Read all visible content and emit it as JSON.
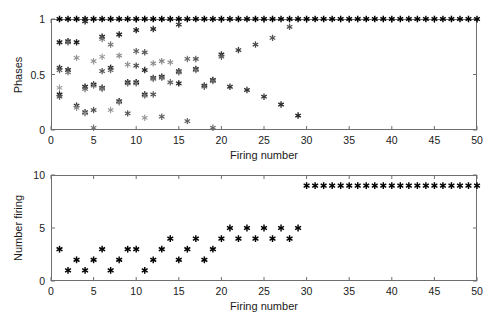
{
  "figure": {
    "background": "#ffffff",
    "axis_color": "#6e6e6e",
    "marker_color": "#111111",
    "marker_glyph": "asterisk"
  },
  "chart_data": [
    {
      "type": "scatter",
      "id": "phases-panel",
      "title": "",
      "xlabel": "Firing number",
      "ylabel": "Phases",
      "xlim": [
        0,
        50
      ],
      "ylim": [
        0,
        1
      ],
      "xticks": [
        0,
        5,
        10,
        15,
        20,
        25,
        30,
        35,
        40,
        45,
        50
      ],
      "xticklabels": [
        "0",
        "5",
        "10",
        "15",
        "20",
        "25",
        "30",
        "35",
        "40",
        "45",
        "50"
      ],
      "yticks": [
        0,
        0.5,
        1
      ],
      "yticklabels": [
        "0",
        "0.5",
        "1"
      ],
      "grid": false,
      "legend": null,
      "series": [
        {
          "name": "reference phase",
          "note": "locked at phase 1 for every firing",
          "x": [
            1,
            2,
            3,
            4,
            5,
            6,
            7,
            8,
            9,
            10,
            11,
            12,
            13,
            14,
            15,
            16,
            17,
            18,
            19,
            20,
            21,
            22,
            23,
            24,
            25,
            26,
            27,
            28,
            29,
            30,
            31,
            32,
            33,
            34,
            35,
            36,
            37,
            38,
            39,
            40,
            41,
            42,
            43,
            44,
            45,
            46,
            47,
            48,
            49,
            50
          ],
          "y": [
            1,
            1,
            1,
            1,
            1,
            1,
            1,
            1,
            1,
            1,
            1,
            1,
            1,
            1,
            1,
            1,
            1,
            1,
            1,
            1,
            1,
            1,
            1,
            1,
            1,
            1,
            1,
            1,
            1,
            1,
            1,
            1,
            1,
            1,
            1,
            1,
            1,
            1,
            1,
            1,
            1,
            1,
            1,
            1,
            1,
            1,
            1,
            1,
            1,
            1
          ],
          "shade": [
            1,
            1,
            1,
            1,
            1,
            1,
            1,
            1,
            1,
            1,
            1,
            1,
            1,
            1,
            1,
            1,
            1,
            1,
            1,
            1,
            1,
            1,
            1,
            1,
            1,
            1,
            1,
            1,
            1,
            1,
            1,
            1,
            1,
            1,
            1,
            1,
            1,
            1,
            1,
            1,
            1,
            1,
            1,
            1,
            1,
            1,
            1,
            1,
            1,
            1
          ]
        },
        {
          "name": "oscillator phases",
          "note": "scattered sub-unity phases, greyscale encodes oscillator index",
          "points": [
            {
              "x": 1,
              "y": 0.79,
              "shade": 0.85
            },
            {
              "x": 1,
              "y": 0.56,
              "shade": 0.8
            },
            {
              "x": 1,
              "y": 0.54,
              "shade": 0.55
            },
            {
              "x": 1,
              "y": 0.32,
              "shade": 0.85
            },
            {
              "x": 1,
              "y": 0.3,
              "shade": 0.6
            },
            {
              "x": 1,
              "y": 0.38,
              "shade": 0.25
            },
            {
              "x": 2,
              "y": 0.8,
              "shade": 0.85
            },
            {
              "x": 2,
              "y": 0.79,
              "shade": 0.5
            },
            {
              "x": 2,
              "y": 0.54,
              "shade": 0.85
            },
            {
              "x": 2,
              "y": 0.52,
              "shade": 0.45
            },
            {
              "x": 3,
              "y": 0.79,
              "shade": 0.85
            },
            {
              "x": 3,
              "y": 0.65,
              "shade": 0.3
            },
            {
              "x": 3,
              "y": 0.22,
              "shade": 0.75
            },
            {
              "x": 3,
              "y": 0.2,
              "shade": 0.35
            },
            {
              "x": 4,
              "y": 0.98,
              "shade": 0.8
            },
            {
              "x": 4,
              "y": 0.39,
              "shade": 0.85
            },
            {
              "x": 4,
              "y": 0.37,
              "shade": 0.5
            },
            {
              "x": 4,
              "y": 0.16,
              "shade": 0.75
            },
            {
              "x": 4,
              "y": 0.15,
              "shade": 0.3
            },
            {
              "x": 5,
              "y": 0.62,
              "shade": 0.3
            },
            {
              "x": 5,
              "y": 0.41,
              "shade": 0.85
            },
            {
              "x": 5,
              "y": 0.4,
              "shade": 0.45
            },
            {
              "x": 5,
              "y": 0.18,
              "shade": 0.6
            },
            {
              "x": 5,
              "y": 0.02,
              "shade": 0.45
            },
            {
              "x": 6,
              "y": 0.84,
              "shade": 0.85
            },
            {
              "x": 6,
              "y": 0.82,
              "shade": 0.45
            },
            {
              "x": 6,
              "y": 0.66,
              "shade": 0.3
            },
            {
              "x": 6,
              "y": 0.53,
              "shade": 0.6
            },
            {
              "x": 6,
              "y": 0.38,
              "shade": 0.85
            },
            {
              "x": 6,
              "y": 0.37,
              "shade": 0.4
            },
            {
              "x": 7,
              "y": 0.77,
              "shade": 0.45
            },
            {
              "x": 7,
              "y": 0.56,
              "shade": 0.85
            },
            {
              "x": 7,
              "y": 0.54,
              "shade": 0.5
            },
            {
              "x": 7,
              "y": 0.18,
              "shade": 0.3
            },
            {
              "x": 8,
              "y": 0.86,
              "shade": 0.85
            },
            {
              "x": 8,
              "y": 0.67,
              "shade": 0.35
            },
            {
              "x": 8,
              "y": 0.26,
              "shade": 0.85
            },
            {
              "x": 8,
              "y": 0.25,
              "shade": 0.4
            },
            {
              "x": 9,
              "y": 0.59,
              "shade": 0.35
            },
            {
              "x": 9,
              "y": 0.43,
              "shade": 0.85
            },
            {
              "x": 9,
              "y": 0.42,
              "shade": 0.5
            },
            {
              "x": 9,
              "y": 0.15,
              "shade": 0.6
            },
            {
              "x": 10,
              "y": 0.9,
              "shade": 0.85
            },
            {
              "x": 10,
              "y": 0.71,
              "shade": 0.55
            },
            {
              "x": 10,
              "y": 0.58,
              "shade": 0.65
            },
            {
              "x": 10,
              "y": 0.43,
              "shade": 0.85
            },
            {
              "x": 10,
              "y": 0.42,
              "shade": 0.45
            },
            {
              "x": 11,
              "y": 0.7,
              "shade": 0.6
            },
            {
              "x": 11,
              "y": 0.54,
              "shade": 0.8
            },
            {
              "x": 11,
              "y": 0.32,
              "shade": 0.85
            },
            {
              "x": 11,
              "y": 0.31,
              "shade": 0.4
            },
            {
              "x": 11,
              "y": 0.11,
              "shade": 0.3
            },
            {
              "x": 12,
              "y": 0.91,
              "shade": 0.8
            },
            {
              "x": 12,
              "y": 0.6,
              "shade": 0.35
            },
            {
              "x": 12,
              "y": 0.47,
              "shade": 0.8
            },
            {
              "x": 12,
              "y": 0.46,
              "shade": 0.45
            },
            {
              "x": 12,
              "y": 0.32,
              "shade": 0.6
            },
            {
              "x": 13,
              "y": 0.62,
              "shade": 0.4
            },
            {
              "x": 13,
              "y": 0.48,
              "shade": 0.85
            },
            {
              "x": 13,
              "y": 0.47,
              "shade": 0.45
            },
            {
              "x": 13,
              "y": 0.12,
              "shade": 0.55
            },
            {
              "x": 14,
              "y": 0.61,
              "shade": 0.35
            },
            {
              "x": 14,
              "y": 0.43,
              "shade": 0.55
            },
            {
              "x": 15,
              "y": 0.95,
              "shade": 0.75
            },
            {
              "x": 15,
              "y": 0.53,
              "shade": 0.8
            },
            {
              "x": 15,
              "y": 0.52,
              "shade": 0.5
            },
            {
              "x": 15,
              "y": 0.42,
              "shade": 0.85
            },
            {
              "x": 16,
              "y": 0.64,
              "shade": 0.5
            },
            {
              "x": 16,
              "y": 0.08,
              "shade": 0.55
            },
            {
              "x": 17,
              "y": 0.64,
              "shade": 0.6
            },
            {
              "x": 17,
              "y": 0.55,
              "shade": 0.85
            },
            {
              "x": 17,
              "y": 0.54,
              "shade": 0.45
            },
            {
              "x": 18,
              "y": 0.4,
              "shade": 0.85
            },
            {
              "x": 18,
              "y": 0.39,
              "shade": 0.5
            },
            {
              "x": 19,
              "y": 0.45,
              "shade": 0.85
            },
            {
              "x": 19,
              "y": 0.44,
              "shade": 0.5
            },
            {
              "x": 19,
              "y": 0.02,
              "shade": 0.5
            },
            {
              "x": 20,
              "y": 0.68,
              "shade": 0.8
            },
            {
              "x": 20,
              "y": 0.66,
              "shade": 0.55
            },
            {
              "x": 21,
              "y": 0.39,
              "shade": 0.75
            },
            {
              "x": 22,
              "y": 0.72,
              "shade": 0.7
            },
            {
              "x": 23,
              "y": 0.36,
              "shade": 0.75
            },
            {
              "x": 24,
              "y": 0.77,
              "shade": 0.65
            },
            {
              "x": 25,
              "y": 0.3,
              "shade": 0.75
            },
            {
              "x": 26,
              "y": 0.83,
              "shade": 0.6
            },
            {
              "x": 27,
              "y": 0.23,
              "shade": 0.8
            },
            {
              "x": 28,
              "y": 0.93,
              "shade": 0.6
            },
            {
              "x": 29,
              "y": 0.13,
              "shade": 0.85
            }
          ]
        }
      ]
    },
    {
      "type": "scatter",
      "id": "number-firing-panel",
      "title": "",
      "xlabel": "Firing number",
      "ylabel": "Number firing",
      "xlim": [
        0,
        50
      ],
      "ylim": [
        0,
        10
      ],
      "xticks": [
        0,
        5,
        10,
        15,
        20,
        25,
        30,
        35,
        40,
        45,
        50
      ],
      "xticklabels": [
        "0",
        "5",
        "10",
        "15",
        "20",
        "25",
        "30",
        "35",
        "40",
        "45",
        "50"
      ],
      "yticks": [
        0,
        5,
        10
      ],
      "yticklabels": [
        "0",
        "5",
        "10"
      ],
      "grid": false,
      "legend": null,
      "x": [
        1,
        2,
        3,
        4,
        5,
        6,
        7,
        8,
        9,
        10,
        11,
        12,
        13,
        14,
        15,
        16,
        17,
        18,
        19,
        20,
        21,
        22,
        23,
        24,
        25,
        26,
        27,
        28,
        29,
        30,
        31,
        32,
        33,
        34,
        35,
        36,
        37,
        38,
        39,
        40,
        41,
        42,
        43,
        44,
        45,
        46,
        47,
        48,
        49,
        50
      ],
      "values": [
        3,
        1,
        2,
        1,
        2,
        3,
        1,
        2,
        3,
        3,
        1,
        2,
        3,
        4,
        2,
        3,
        4,
        2,
        3,
        4,
        5,
        4,
        5,
        4,
        5,
        4,
        5,
        4,
        5,
        9,
        9,
        9,
        9,
        9,
        9,
        9,
        9,
        9,
        9,
        9,
        9,
        9,
        9,
        9,
        9,
        9,
        9,
        9,
        9,
        9
      ]
    }
  ]
}
